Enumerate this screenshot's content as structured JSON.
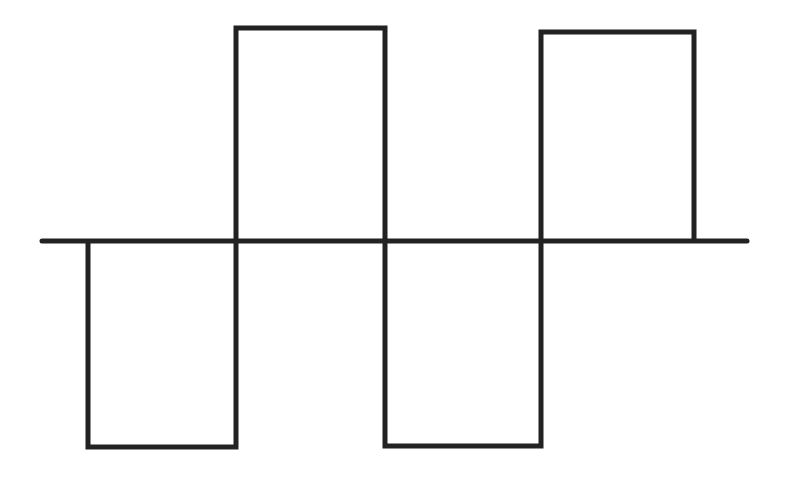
{
  "diagram": {
    "type": "square-wave",
    "stroke_color": "#222222",
    "background": "#ffffff",
    "stroke_width": 5,
    "axis": {
      "x1": 42,
      "x2": 747,
      "y": 241
    },
    "pulses": [
      {
        "polarity": "negative",
        "x_start": 88,
        "x_end": 236,
        "level": 447
      },
      {
        "polarity": "positive",
        "x_start": 236,
        "x_end": 385,
        "level": 28
      },
      {
        "polarity": "negative",
        "x_start": 385,
        "x_end": 541,
        "level": 446
      },
      {
        "polarity": "positive",
        "x_start": 541,
        "x_end": 694,
        "level": 32
      }
    ]
  }
}
